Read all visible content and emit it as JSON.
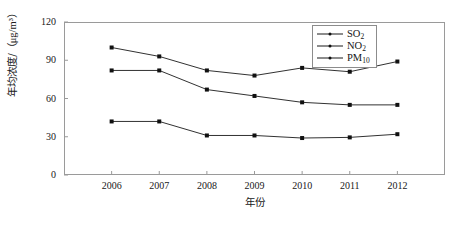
{
  "chart_data": {
    "type": "line",
    "title": "",
    "xlabel": "年份",
    "ylabel": "年均浓度/（μg/m³）",
    "categories": [
      "2006",
      "2007",
      "2008",
      "2009",
      "2010",
      "2011",
      "2012"
    ],
    "x": [
      2006,
      2007,
      2008,
      2009,
      2010,
      2011,
      2012
    ],
    "ylim": [
      0,
      120
    ],
    "yticks": [
      0,
      30,
      60,
      90,
      120
    ],
    "grid": false,
    "legend_position": "top-right",
    "series": [
      {
        "name": "SO2",
        "label_main": "SO",
        "label_sub": "2",
        "values": [
          42,
          42,
          31,
          31,
          29,
          29.5,
          32
        ]
      },
      {
        "name": "NO2",
        "label_main": "NO",
        "label_sub": "2",
        "values": [
          82,
          82,
          67,
          62,
          57,
          55,
          55
        ]
      },
      {
        "name": "PM10",
        "label_main": "PM",
        "label_sub": "10",
        "values": [
          100,
          93,
          82,
          78,
          84,
          81,
          89
        ]
      }
    ],
    "line_color": "#1a1a1a",
    "marker_color": "#111111",
    "axis_color": "#9a9a9a",
    "background": "#ffffff"
  },
  "axis": {
    "y_tick_labels": [
      "120",
      "90",
      "60",
      "30",
      "0"
    ],
    "x_tick_labels": [
      "2006",
      "2007",
      "2008",
      "2009",
      "2010",
      "2011",
      "2012"
    ],
    "y_title_name": "年均浓度/",
    "y_title_unit": "（μg/m³）",
    "x_title": "年份"
  }
}
